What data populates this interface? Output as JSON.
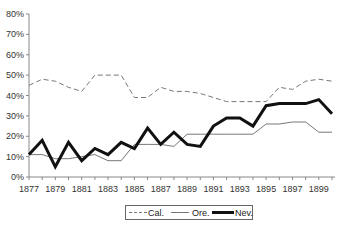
{
  "chart_data": {
    "type": "line",
    "title": "",
    "xlabel": "",
    "ylabel": "",
    "x": [
      1877,
      1878,
      1879,
      1880,
      1881,
      1882,
      1883,
      1884,
      1885,
      1886,
      1887,
      1888,
      1889,
      1890,
      1891,
      1892,
      1893,
      1894,
      1895,
      1896,
      1897,
      1898,
      1899,
      1900
    ],
    "x_tick_labels": [
      "1877",
      "1879",
      "1881",
      "1883",
      "1885",
      "1887",
      "1889",
      "1891",
      "1893",
      "1895",
      "1897",
      "1899"
    ],
    "y_tick_labels": [
      "0%",
      "10%",
      "20%",
      "30%",
      "40%",
      "50%",
      "60%",
      "70%",
      "80%"
    ],
    "ylim": [
      0,
      80
    ],
    "y_unit": "%",
    "grid": false,
    "legend_position": "bottom",
    "series": [
      {
        "name": "Cal.",
        "style": "dashed",
        "color": "#777777",
        "width": 1,
        "values": [
          45,
          48,
          47,
          44,
          42,
          50,
          50,
          50,
          39,
          39,
          44,
          42,
          42,
          41,
          39,
          37,
          37,
          37,
          37,
          44,
          43,
          47,
          48,
          47
        ]
      },
      {
        "name": "Ore.",
        "style": "solid",
        "color": "#777777",
        "width": 1,
        "values": [
          11,
          11,
          9,
          9,
          10,
          11,
          8,
          8,
          16,
          16,
          16,
          15,
          21,
          21,
          21,
          21,
          21,
          21,
          26,
          26,
          27,
          27,
          22,
          22
        ]
      },
      {
        "name": "Nev.",
        "style": "solid",
        "color": "#111111",
        "width": 3,
        "values": [
          11,
          18,
          5,
          17,
          8,
          14,
          11,
          17,
          14,
          24,
          16,
          22,
          16,
          15,
          25,
          29,
          29,
          25,
          35,
          36,
          36,
          36,
          38,
          31
        ]
      }
    ]
  },
  "legend": {
    "items": [
      {
        "label": "Cal."
      },
      {
        "label": "Ore."
      },
      {
        "label": "Nev."
      }
    ]
  }
}
